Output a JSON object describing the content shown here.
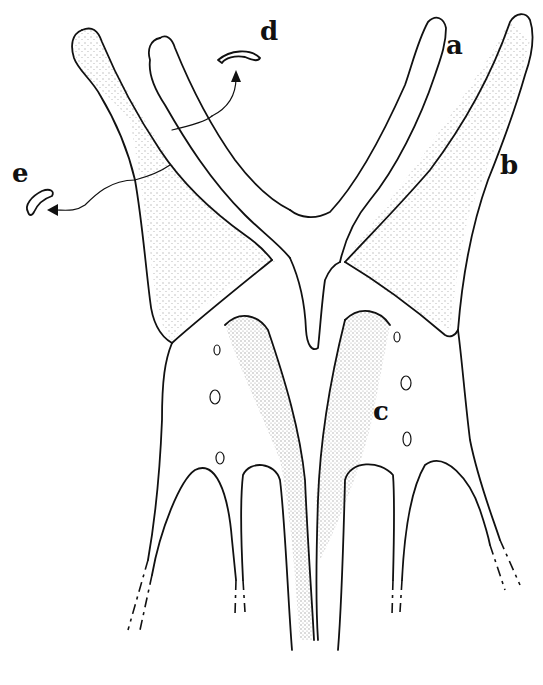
{
  "figure": {
    "labels": {
      "a": "a",
      "b": "b",
      "c": "c",
      "d": "d",
      "e": "e"
    },
    "colors": {
      "line": "#111111",
      "background": "#ffffff",
      "stipple": "#222222"
    }
  }
}
